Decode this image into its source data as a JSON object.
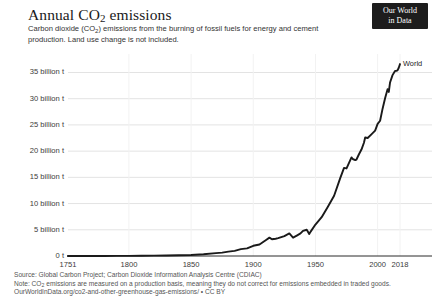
{
  "header": {
    "title_main": "Annual CO",
    "title_sub": "2",
    "title_tail": " emissions",
    "subtitle_part1": "Carbon dioxide (CO",
    "subtitle_sub": "2",
    "subtitle_part2": ") emissions from the burning of fossil fuels for energy and cement production. Land use change is not included.",
    "logo_line1": "Our World",
    "logo_line2": "in Data"
  },
  "footer": {
    "source": "Source: Global Carbon Project; Carbon Dioxide Information Analysis Centre (CDIAC)",
    "note_part1": "Note: CO",
    "note_sub": "2",
    "note_part2": " emissions are measured on a production basis, meaning they do not correct for emissions embedded in traded goods.",
    "license": "OurWorldInData.org/co2-and-other-greenhouse-gas-emissions/ • CC BY"
  },
  "colors": {
    "line": "#1a1a1a",
    "grid": "#e3e3e3",
    "axis": "#2b2b2b",
    "text": "#3b3b3b",
    "logo_bg": "#1d1d1d"
  },
  "chart_data": {
    "type": "line",
    "title": "Annual CO2 emissions",
    "subtitle": "Carbon dioxide (CO2) emissions from the burning of fossil fuels for energy and cement production. Land use change is not included.",
    "xlabel": "",
    "ylabel": "",
    "xlim": [
      1751,
      2018
    ],
    "ylim": [
      0,
      37
    ],
    "grid": true,
    "legend_position": "end-of-line",
    "y_ticks": [
      0,
      5,
      10,
      15,
      20,
      25,
      30,
      35
    ],
    "y_tick_labels": [
      "0 t",
      "5 billion t",
      "10 billion t",
      "15 billion t",
      "20 billion t",
      "25 billion t",
      "30 billion t",
      "35 billion t"
    ],
    "x_ticks": [
      1751,
      1800,
      1850,
      1900,
      1950,
      2000,
      2018
    ],
    "x_tick_labels": [
      "1751",
      "1800",
      "1850",
      "1900",
      "1950",
      "2000",
      "2018"
    ],
    "series": [
      {
        "name": "World",
        "color": "#1a1a1a",
        "unit": "billion tonnes CO2",
        "x": [
          1751,
          1760,
          1770,
          1780,
          1790,
          1800,
          1810,
          1820,
          1830,
          1840,
          1850,
          1860,
          1870,
          1875,
          1880,
          1885,
          1890,
          1895,
          1900,
          1905,
          1910,
          1913,
          1915,
          1918,
          1920,
          1925,
          1929,
          1932,
          1935,
          1938,
          1940,
          1943,
          1945,
          1946,
          1950,
          1955,
          1960,
          1965,
          1970,
          1973,
          1975,
          1979,
          1980,
          1982,
          1983,
          1985,
          1987,
          1989,
          1990,
          1992,
          1995,
          1998,
          2000,
          2002,
          2004,
          2006,
          2008,
          2009,
          2010,
          2012,
          2014,
          2015,
          2016,
          2017,
          2018
        ],
        "y": [
          0.009,
          0.01,
          0.011,
          0.013,
          0.016,
          0.03,
          0.05,
          0.07,
          0.1,
          0.15,
          0.2,
          0.32,
          0.54,
          0.65,
          0.84,
          0.98,
          1.3,
          1.45,
          1.95,
          2.2,
          3.0,
          3.5,
          3.2,
          3.3,
          3.4,
          3.8,
          4.3,
          3.5,
          3.9,
          4.3,
          4.8,
          5.0,
          4.2,
          4.6,
          6.0,
          7.4,
          9.4,
          11.5,
          14.9,
          16.8,
          16.7,
          18.8,
          18.5,
          18.3,
          18.4,
          19.4,
          20.3,
          21.6,
          22.6,
          22.5,
          23.2,
          23.9,
          25.2,
          25.8,
          28.1,
          30.1,
          31.8,
          31.3,
          33.1,
          34.5,
          35.3,
          35.3,
          35.4,
          35.9,
          36.6
        ]
      }
    ],
    "annotations": [
      {
        "text": "World",
        "x": 2018,
        "y": 36.6
      }
    ]
  }
}
